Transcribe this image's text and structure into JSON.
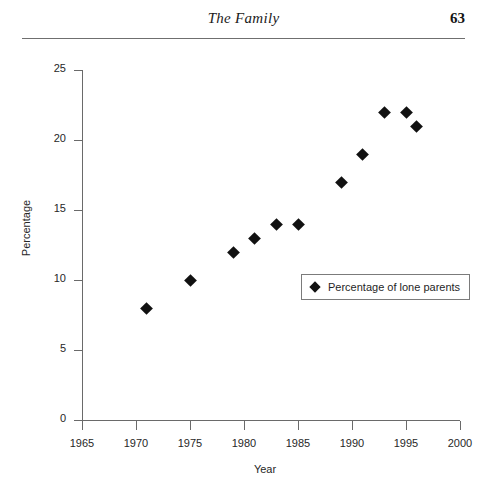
{
  "page": {
    "running_head_title": "The Family",
    "folio": "63"
  },
  "chart_data": {
    "type": "scatter",
    "title": "",
    "xlabel": "Year",
    "ylabel": "Percentage",
    "xlim": [
      1965,
      2000
    ],
    "ylim": [
      0,
      25
    ],
    "grid": false,
    "legend_position": "inside-right",
    "x_ticks": [
      "1965",
      "1970",
      "1975",
      "1980",
      "1985",
      "1990",
      "1995",
      "2000"
    ],
    "y_ticks": [
      "0",
      "5",
      "10",
      "15",
      "20",
      "25"
    ],
    "series": [
      {
        "name": "Percentage of lone parents",
        "marker": "diamond",
        "color": "#111111",
        "points": [
          {
            "x": 1971,
            "y": 8
          },
          {
            "x": 1975,
            "y": 10
          },
          {
            "x": 1979,
            "y": 12
          },
          {
            "x": 1981,
            "y": 13
          },
          {
            "x": 1983,
            "y": 14
          },
          {
            "x": 1985,
            "y": 14
          },
          {
            "x": 1989,
            "y": 17
          },
          {
            "x": 1991,
            "y": 19
          },
          {
            "x": 1993,
            "y": 22
          },
          {
            "x": 1995,
            "y": 22
          },
          {
            "x": 1996,
            "y": 21
          }
        ]
      }
    ]
  },
  "legend": {
    "entries": [
      {
        "label": "Percentage of lone parents"
      }
    ]
  }
}
